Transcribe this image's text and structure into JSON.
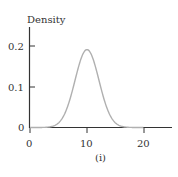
{
  "chart_data": {
    "type": "line",
    "title": "",
    "subtitle": "(i)",
    "xlabel": "",
    "ylabel": "Density",
    "xlim": [
      0,
      25
    ],
    "ylim": [
      0,
      0.25
    ],
    "x_ticks": [
      0,
      10,
      20
    ],
    "x_tick_labels": [
      "0",
      "10",
      "20"
    ],
    "y_ticks": [
      0,
      0.1,
      0.2
    ],
    "y_tick_labels": [
      "0",
      "0.1",
      "0.2"
    ],
    "grid": false,
    "legend": null,
    "series": [
      {
        "name": "Normal density (mean 10, sd ~2.1)",
        "color": "#b0b0b0",
        "x": [
          0,
          2,
          4,
          5,
          6,
          7,
          8,
          9,
          10,
          11,
          12,
          13,
          14,
          15,
          16,
          18,
          20
        ],
        "values": [
          0.0,
          0.0003,
          0.0032,
          0.0112,
          0.0312,
          0.0686,
          0.1208,
          0.1698,
          0.19,
          0.1698,
          0.1208,
          0.0686,
          0.0312,
          0.0112,
          0.0032,
          0.0003,
          0.0
        ]
      }
    ]
  },
  "labels": {
    "ylabel": "Density",
    "caption": "(i)",
    "x0": "0",
    "x10": "10",
    "x20": "20",
    "y0": "0",
    "y01": "0.1",
    "y02": "0.2"
  },
  "colors": {
    "axis": "#333333",
    "curve": "#b0b0b0"
  }
}
